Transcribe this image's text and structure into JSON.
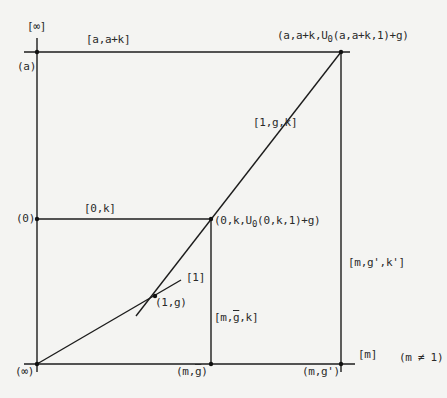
{
  "diagram": {
    "type": "projective-plane coordinatization diagram",
    "colors": {
      "line": "#1c1c1c",
      "point": "#111111",
      "text": "#2a2a2a",
      "background": "#f4f4f2"
    },
    "lines": {
      "infinity": "[∞]",
      "a_line": "[a,a+k]",
      "zero_line": "[0,k]",
      "one_line": "[1]",
      "diag_line": "[1,g,k]",
      "m_g_bar_line_prefix": "[m,",
      "m_g_bar_line_gbar": "g",
      "m_g_bar_line_suffix": ",k]",
      "m_gprime_line": "[m,g',k']",
      "m_line": "[m]"
    },
    "points": {
      "a": "(a)",
      "zero": "(0)",
      "infinity": "(∞)",
      "one_g": "(1,g)",
      "m_gbar_prefix": "(m,",
      "m_gbar_g": "g",
      "m_gbar_suffix": ")",
      "m_gprime": "(m,g')",
      "zero_k_prefix": "(0,k,U",
      "zero_k_sub": "0",
      "zero_k_suffix": "(0,k,1)+g)",
      "top_right_prefix": "(a,a+k,U",
      "top_right_sub": "0",
      "top_right_suffix": "(a,a+k,1)+g)"
    },
    "condition": "(m ≠ 1)"
  }
}
